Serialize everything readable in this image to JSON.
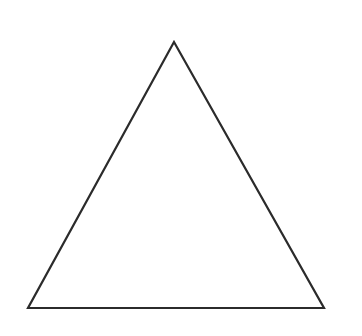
{
  "canvas": {
    "width": 362,
    "height": 336,
    "background": "#ffffff"
  },
  "shapes": [
    {
      "type": "triangle",
      "name": "equilateral-triangle-outline",
      "points": [
        [
          174,
          42
        ],
        [
          324,
          308
        ],
        [
          28,
          308
        ]
      ],
      "stroke": "#2b2b2b",
      "stroke_width": 2.2,
      "fill": "none"
    }
  ]
}
